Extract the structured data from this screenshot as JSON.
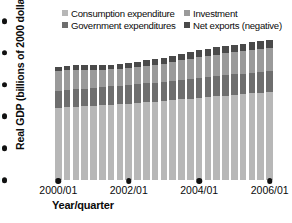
{
  "chart_data": {
    "type": "bar",
    "stacked": true,
    "title": "",
    "xlabel": "Year/quarter",
    "ylabel": "Real GDP (billions of 2000 dollars)",
    "ylim": [
      0,
      15000
    ],
    "yticks": [
      "0",
      "3,000",
      "6,000",
      "9,000",
      "12,000",
      "15,000"
    ],
    "ytick_values": [
      0,
      3000,
      6000,
      9000,
      12000,
      15000
    ],
    "xtick_labels": [
      "2000/01",
      "2002/01",
      "2004/01",
      "2006/01"
    ],
    "xtick_indices": [
      0,
      8,
      16,
      24
    ],
    "grid": false,
    "legend_position": "top",
    "categories": [
      "2000/01",
      "2000/02",
      "2000/03",
      "2000/04",
      "2001/01",
      "2001/02",
      "2001/03",
      "2001/04",
      "2002/01",
      "2002/02",
      "2002/03",
      "2002/04",
      "2003/01",
      "2003/02",
      "2003/03",
      "2003/04",
      "2004/01",
      "2004/02",
      "2004/03",
      "2004/04",
      "2005/01",
      "2005/02",
      "2005/03",
      "2005/04",
      "2006/01"
    ],
    "series": [
      {
        "name": "Consumption expenditure",
        "color": "#b7b7b7",
        "values": [
          6800,
          6870,
          6920,
          6950,
          7000,
          7060,
          7120,
          7150,
          7210,
          7270,
          7330,
          7380,
          7440,
          7530,
          7610,
          7680,
          7760,
          7830,
          7900,
          7970,
          8040,
          8110,
          8180,
          8250,
          8330
        ]
      },
      {
        "name": "Government expenditures",
        "color": "#6e6e6e",
        "values": [
          1640,
          1650,
          1660,
          1670,
          1690,
          1710,
          1730,
          1750,
          1770,
          1790,
          1800,
          1810,
          1830,
          1845,
          1860,
          1870,
          1885,
          1895,
          1905,
          1915,
          1925,
          1935,
          1945,
          1955,
          1965
        ]
      },
      {
        "name": "Investment",
        "color": "#9a9a9a",
        "values": [
          1840,
          1855,
          1845,
          1800,
          1720,
          1650,
          1610,
          1595,
          1600,
          1630,
          1660,
          1690,
          1720,
          1770,
          1830,
          1890,
          1950,
          1995,
          2030,
          2060,
          2090,
          2120,
          2150,
          2175,
          2200
        ]
      },
      {
        "name": "Net exports (negative)",
        "color": "#4a4a4a",
        "values": [
          380,
          400,
          420,
          430,
          420,
          410,
          420,
          440,
          460,
          490,
          520,
          545,
          570,
          600,
          620,
          635,
          650,
          665,
          680,
          690,
          700,
          710,
          720,
          730,
          740
        ]
      }
    ]
  },
  "legend": {
    "items": [
      {
        "label": "Consumption expenditure",
        "color": "#b7b7b7"
      },
      {
        "label": "Investment",
        "color": "#9a9a9a"
      },
      {
        "label": "Government expenditures",
        "color": "#6e6e6e"
      },
      {
        "label": "Net exports (negative)",
        "color": "#4a4a4a"
      }
    ]
  }
}
